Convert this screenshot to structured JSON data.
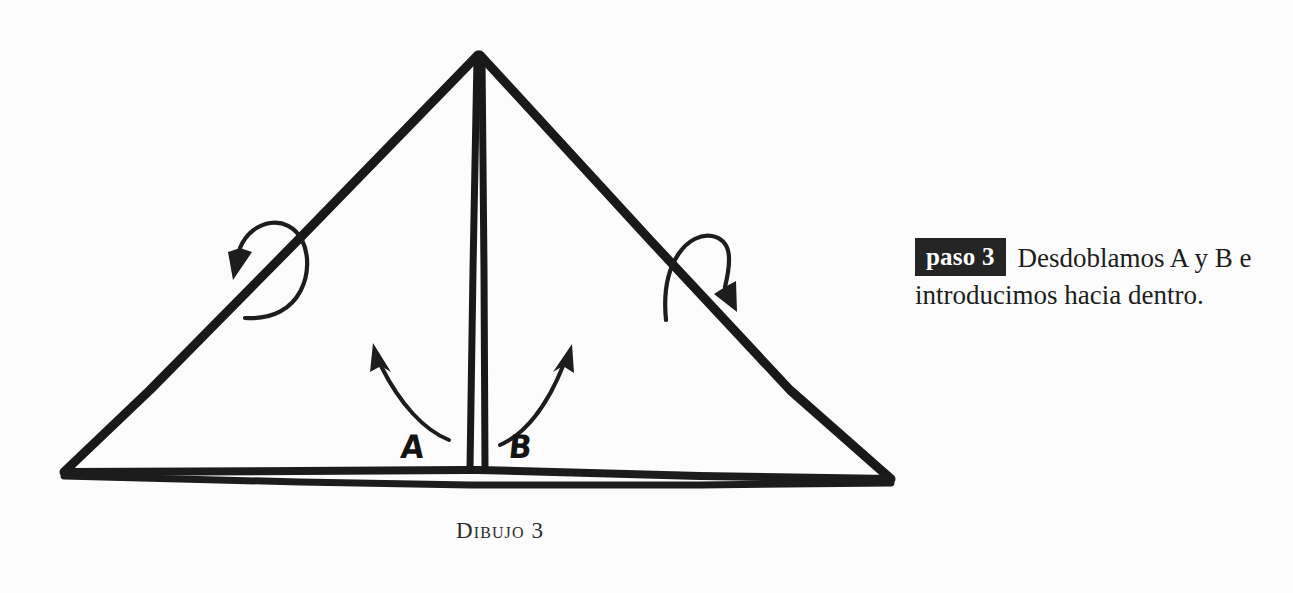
{
  "page": {
    "background_color": "#fcfcfc",
    "ink_color": "#1a1a1a",
    "width": 1293,
    "height": 593
  },
  "diagram": {
    "name": "paper-folding-triangle",
    "caption": "Dibujo 3",
    "shape": "triangle",
    "vertices": {
      "apex": [
        478,
        52
      ],
      "left_base": [
        62,
        475
      ],
      "right_base": [
        893,
        483
      ]
    },
    "center_fold_line": {
      "from": [
        478,
        55
      ],
      "to": [
        470,
        470
      ],
      "style": "double-stroke-vertical"
    },
    "base_flap": {
      "from": [
        62,
        475
      ],
      "to": [
        893,
        483
      ],
      "style": "thin-sliver-double-line"
    },
    "labels": [
      {
        "id": "a",
        "text": "A",
        "x": 401,
        "y": 432
      },
      {
        "id": "b",
        "text": "B",
        "x": 509,
        "y": 432
      }
    ],
    "arrows": [
      {
        "id": "left-outer",
        "direction": "down-left",
        "description": "curved arrow folding the left slanted edge downward"
      },
      {
        "id": "right-outer",
        "direction": "down-right",
        "description": "curved arrow folding the right slanted edge downward"
      },
      {
        "id": "a-inner",
        "direction": "up-left",
        "description": "curved arrow lifting flap A upward and inward"
      },
      {
        "id": "b-inner",
        "direction": "up-right",
        "description": "curved arrow lifting flap B upward and inward"
      }
    ]
  },
  "instruction": {
    "badge_label": "paso 3",
    "badge_background": "#242424",
    "badge_text_color": "#ffffff",
    "body_text": "Desdoblamos A y B e introducimos hacia dentro."
  }
}
